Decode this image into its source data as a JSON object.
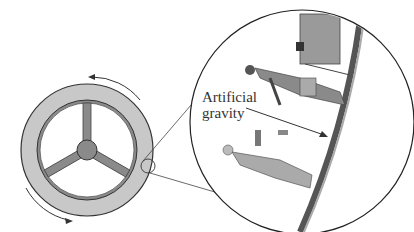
{
  "diagram": {
    "label": {
      "line1": "Artificial",
      "line2": "gravity"
    },
    "colors": {
      "ring_fill": "#c8c8c8",
      "spoke_fill": "#8a8a8a",
      "stroke": "#333333",
      "figure_fill": "#9a9a9a"
    }
  }
}
